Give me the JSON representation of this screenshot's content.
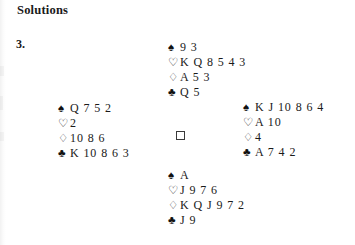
{
  "document": {
    "heading": "Solutions",
    "problem_number": "3."
  },
  "suits": {
    "spade": "♠",
    "heart": "♡",
    "diamond": "♢",
    "club": "♣"
  },
  "deal": {
    "center_marker": "□",
    "north": {
      "position_name": "North",
      "spades": "9 3",
      "hearts": "K Q 8 5 4 3",
      "diamonds": "A 5 3",
      "clubs": "Q 5"
    },
    "west": {
      "position_name": "West",
      "spades": "Q 7 5 2",
      "hearts": "2",
      "diamonds": "10 8 6",
      "clubs": "K 10 8 6 3"
    },
    "east": {
      "position_name": "East",
      "spades": "K J 10 8 6 4",
      "hearts": "A 10",
      "diamonds": "4",
      "clubs": "A 7 4 2"
    },
    "south": {
      "position_name": "South",
      "spades": "A",
      "hearts": "J 9 7 6",
      "diamonds": "K Q J 9 7 2",
      "clubs": "J 9"
    }
  }
}
